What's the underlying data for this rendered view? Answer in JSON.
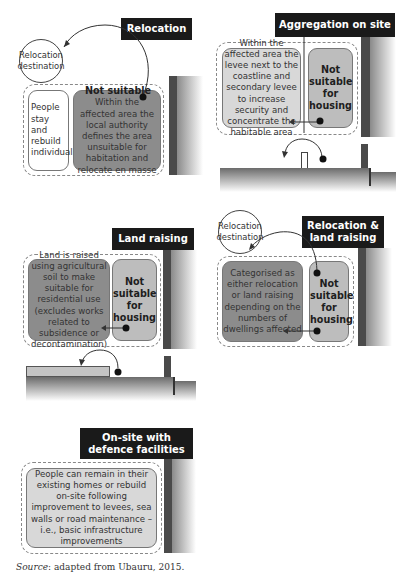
{
  "panels": {
    "relocation": {
      "title": "Relocation",
      "destination": "Relocation destination",
      "left_box": "People stay and rebuild individually",
      "right_box_heading": "Not suitable",
      "right_box_text": "Within the affected area the local authority defines the area unsuitable for habitation and relocate en masse"
    },
    "aggregation": {
      "title": "Aggregation on site",
      "left_box": "Within the affected area the levee next to the coastline and secondary levee to increase security and concentrate the habitable area",
      "right_box": "Not suitable for housing"
    },
    "land_raising": {
      "title": "Land raising",
      "left_box": "Land is raised using agricultural soil to make suitable for residential use (excludes works related to subsidence or decontamination)",
      "right_box": "Not suitable for housing"
    },
    "relocation_land_raising": {
      "title": "Relocation & land raising",
      "destination": "Relocation destination",
      "left_box": "Categorised as either relocation or land raising depending on the numbers of dwellings affected",
      "right_box": "Not suitable for housing"
    },
    "onsite_defence": {
      "title": "On-site with defence facilities",
      "box": "People can remain in their existing homes or rebuild on-site following improvement to levees, sea walls or road maintenance – i.e., basic infrastructure improvements"
    }
  },
  "source": {
    "label": "Source",
    "text": ": adapted from Ubauru, 2015."
  },
  "colors": {
    "title_bg": "#1a1a1a",
    "wall": "#4a4a4a",
    "dark_box": "#8c8c8c",
    "mid_box": "#bdbdbd",
    "light_box": "#d8d8d8"
  }
}
